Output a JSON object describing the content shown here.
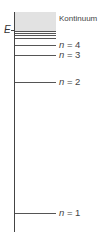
{
  "diagram": {
    "axis_label": "E",
    "continuum_label": "Kontinuum",
    "levels": [
      {
        "n": "1",
        "label_prefix": "n",
        "label_eq": " = 1",
        "y": 213
      },
      {
        "n": "2",
        "label_prefix": "n",
        "label_eq": " = 2",
        "y": 82
      },
      {
        "n": "3",
        "label_prefix": "n",
        "label_eq": " = 3",
        "y": 55
      },
      {
        "n": "4",
        "label_prefix": "n",
        "label_eq": " = 4",
        "y": 45
      }
    ],
    "colors": {
      "continuum": "#e2e2e2",
      "lines": "#555555"
    }
  }
}
